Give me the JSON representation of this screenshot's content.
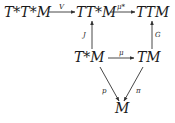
{
  "diagram": {
    "type": "commutative-diagram",
    "nodes": {
      "ttstar_tstar_m": "T*T*M",
      "t_tstar_m": "TT*M",
      "ttm": "TTM",
      "tstar_m": "T*M",
      "tm": "TM",
      "m": "M"
    },
    "edges": {
      "v": {
        "label": "V",
        "from": "T*T*M",
        "to": "TT*M"
      },
      "mu_star": {
        "label": "μ*",
        "from": "TT*M",
        "to": "TTM"
      },
      "j": {
        "label": "J",
        "from": "T*M",
        "to": "TT*M"
      },
      "g": {
        "label": "G",
        "from": "TM",
        "to": "TTM"
      },
      "mu": {
        "label": "μ",
        "from": "T*M",
        "to": "TM"
      },
      "p": {
        "label": "p",
        "from": "T*M",
        "to": "M"
      },
      "pi": {
        "label": "π",
        "from": "TM",
        "to": "M"
      }
    },
    "colors": {
      "ink": "#1a1a1a",
      "background": "#ffffff"
    }
  }
}
